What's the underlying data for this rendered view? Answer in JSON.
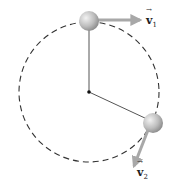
{
  "diagram": {
    "circle": {
      "cx": 89,
      "cy": 92,
      "r": 70,
      "style": "dashed",
      "color": "#333333"
    },
    "pivot": {
      "x": 89,
      "y": 92
    },
    "balls": [
      {
        "id": "ball-1",
        "x": 89,
        "y": 21,
        "r": 10
      },
      {
        "id": "ball-2",
        "x": 153,
        "y": 123,
        "r": 10
      }
    ],
    "vectors": [
      {
        "id": "v1",
        "label_main": "v",
        "label_sub": "1",
        "from": [
          99,
          20
        ],
        "to": [
          138,
          20
        ]
      },
      {
        "id": "v2",
        "label_main": "v",
        "label_sub": "2",
        "from": [
          148,
          131
        ],
        "to": [
          134,
          168
        ]
      }
    ],
    "colors": {
      "arrow": "#aaaaaa",
      "rod": "#555555",
      "ball_light": "#e8e8e8",
      "ball_dark": "#8c8c8c"
    }
  }
}
